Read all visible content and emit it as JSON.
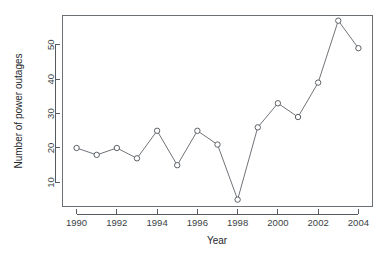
{
  "chart_data": {
    "type": "line",
    "title": "",
    "xlabel": "Year",
    "ylabel": "Number of power outages",
    "x": [
      1990,
      1991,
      1992,
      1993,
      1994,
      1995,
      1996,
      1997,
      1998,
      1999,
      2000,
      2001,
      2002,
      2003,
      2004
    ],
    "categories": [
      "1990",
      "1991",
      "1992",
      "1993",
      "1994",
      "1995",
      "1996",
      "1997",
      "1998",
      "1999",
      "2000",
      "2001",
      "2002",
      "2003",
      "2004"
    ],
    "values": [
      20,
      18,
      20,
      17,
      25,
      15,
      25,
      21,
      5,
      26,
      33,
      29,
      39,
      57,
      49
    ],
    "series": [
      {
        "name": "Number of power outages",
        "values": [
          20,
          18,
          20,
          17,
          25,
          15,
          25,
          21,
          5,
          26,
          33,
          29,
          39,
          57,
          49
        ]
      }
    ],
    "xlim": [
      1989.3,
      2004.7
    ],
    "ylim": [
      3,
      58.5
    ],
    "xticks": [
      1990,
      1992,
      1994,
      1996,
      1998,
      2000,
      2002,
      2004
    ],
    "xtick_labels": [
      "1990",
      "1992",
      "1994",
      "1996",
      "1998",
      "2000",
      "2002",
      "2004"
    ],
    "yticks": [
      10,
      20,
      30,
      40,
      50
    ],
    "ytick_labels": [
      "10",
      "20",
      "30",
      "40",
      "50"
    ],
    "grid": false,
    "legend": false,
    "legend_position": "none",
    "marker": "open-circle",
    "line_color": "#6f7479",
    "marker_fill": "#ffffff",
    "marker_stroke": "#5d6267",
    "axis_color": "#555a5e",
    "background": "#ffffff"
  },
  "axis_labels": {
    "x_title": "Year",
    "y_title": "Number of power outages"
  }
}
